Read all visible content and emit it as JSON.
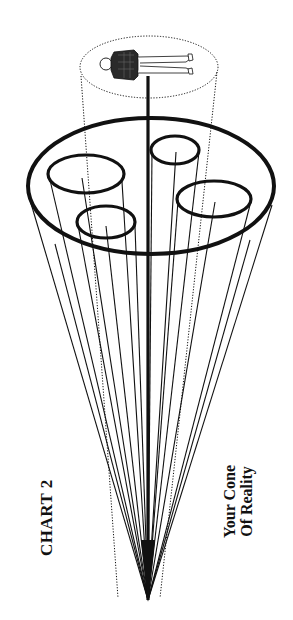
{
  "diagram": {
    "title": "CHART 2",
    "caption_line1": "Your Cone",
    "caption_line2": "Of Reality",
    "colors": {
      "ink": "#111111",
      "background": "#ffffff"
    },
    "apex": {
      "x": 148,
      "y": 600
    },
    "outer_ellipse": {
      "cx": 151,
      "cy": 186,
      "rx": 123,
      "ry": 68
    },
    "inner_ellipses": [
      {
        "name": "upper-left",
        "cx": 86,
        "cy": 174,
        "rx": 38,
        "ry": 19
      },
      {
        "name": "lower-left",
        "cx": 106,
        "cy": 222,
        "rx": 29,
        "ry": 16
      },
      {
        "name": "upper-right",
        "cx": 175,
        "cy": 150,
        "rx": 24,
        "ry": 14
      },
      {
        "name": "lower-right",
        "cx": 214,
        "cy": 199,
        "rx": 37,
        "ry": 18
      }
    ],
    "person_ellipse": {
      "cx": 149,
      "cy": 67,
      "rx": 69,
      "ry": 31,
      "style": "dotted"
    },
    "figure": "person-lying-figure"
  }
}
